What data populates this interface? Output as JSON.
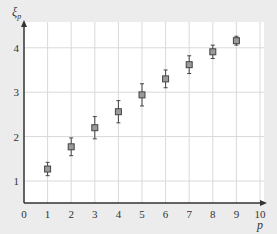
{
  "chart_data": {
    "type": "scatter",
    "title": "",
    "xlabel": "p",
    "ylabel": "ξ_p",
    "xlim": [
      0,
      10
    ],
    "ylim": [
      0.5,
      4.5
    ],
    "x_ticks": [
      "0",
      "1",
      "2",
      "3",
      "4",
      "5",
      "6",
      "7",
      "8",
      "9",
      "10"
    ],
    "y_ticks": [
      "1",
      "2",
      "3",
      "4"
    ],
    "grid": true,
    "legend": null,
    "series": [
      {
        "name": "ξ_p",
        "marker": "square",
        "x": [
          1,
          2,
          3,
          4,
          5,
          6,
          7,
          8,
          9
        ],
        "y": [
          1.27,
          1.77,
          2.2,
          2.56,
          2.94,
          3.3,
          3.62,
          3.91,
          4.16
        ],
        "error": [
          0.15,
          0.2,
          0.25,
          0.25,
          0.25,
          0.2,
          0.2,
          0.15,
          0.1
        ]
      }
    ]
  },
  "colors": {
    "background": "#ececec",
    "plot_area": "#ffffff",
    "grid": "#d9d9d9",
    "axis": "#333333",
    "marker_fill": "#9a9a9a",
    "marker_edge": "#444444"
  }
}
